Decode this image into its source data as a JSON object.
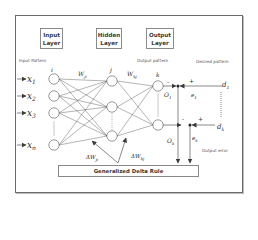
{
  "diagram": {
    "layers": {
      "input": {
        "label_line1": "Input",
        "label_line2": "Layer"
      },
      "hidden": {
        "label_line1": "Hidden",
        "label_line2": "Layer"
      },
      "output": {
        "label_line1": "Output",
        "label_line2": "Layer"
      }
    },
    "captions": {
      "input_pattern": "Input Pattern",
      "output_pattern": "Output pattern",
      "desired_pattern": "Desired pattern",
      "output_error": "Output error"
    },
    "indices": {
      "input": "i",
      "hidden": "j",
      "output": "k"
    },
    "weights": {
      "input_hidden": "W",
      "input_hidden_sub": "ji",
      "hidden_output": "W",
      "hidden_output_sub": "kj"
    },
    "inputs": [
      {
        "name": "x",
        "sub": "1"
      },
      {
        "name": "x",
        "sub": "2"
      },
      {
        "name": "x",
        "sub": "3"
      },
      {
        "name": "x",
        "sub": "n"
      }
    ],
    "outputs": [
      {
        "name": "O",
        "sub": "1"
      },
      {
        "name": "O",
        "sub": "k"
      }
    ],
    "errors": [
      {
        "name": "e",
        "sub": "1"
      },
      {
        "name": "e",
        "sub": "k"
      }
    ],
    "desired": [
      {
        "name": "d",
        "sub": "1"
      },
      {
        "name": "d",
        "sub": "k"
      }
    ],
    "deltas": {
      "ji": {
        "name": "ΔW",
        "sub": "ji"
      },
      "kj": {
        "name": "ΔW",
        "sub": "kj"
      }
    },
    "signs": {
      "minus": "-",
      "plus": "+"
    },
    "rule_label": "Generalized Delta Rule",
    "colors": {
      "line": "#4a4a4a",
      "text": "#2e2e2e",
      "border": "#6a6a6a"
    }
  }
}
